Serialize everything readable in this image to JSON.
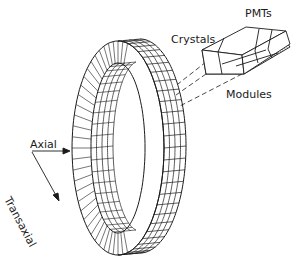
{
  "diagram": {
    "type": "PET detector ring schematic",
    "labels": {
      "pmts": "PMTs",
      "crystals": "Crystals",
      "modules": "Modules",
      "axial": "Axial",
      "transaxial": "Transaxial"
    },
    "colors": {
      "line": "#1a1a1a",
      "background": "#ffffff",
      "hatch": "#555555"
    },
    "ring": {
      "crystal_segments_inner_face": 60,
      "axial_rows": 4
    },
    "block": {
      "pmt_columns": 3
    }
  }
}
